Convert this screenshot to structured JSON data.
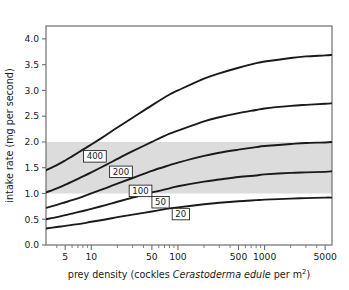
{
  "chart_data": {
    "type": "line",
    "title": "",
    "xlabel": "prey density (cockles Cerastoderma edule per m2)",
    "xlabel_parts": {
      "before": "prey density (cockles ",
      "italic": "Cerastoderma edule",
      "after": " per m",
      "superscript": "2",
      "tail": ")"
    },
    "ylabel": "intake rate (mg per second)",
    "xscale": "log",
    "yscale": "linear",
    "xlim": [
      3,
      6000
    ],
    "ylim": [
      0.0,
      4.25
    ],
    "grid": false,
    "legend": "inline-curve-labels",
    "xticks": [
      5,
      10,
      50,
      100,
      500,
      1000,
      5000
    ],
    "xticklabels": [
      "5",
      "10",
      "50",
      "100",
      "500",
      "1000",
      "5000"
    ],
    "xminorticks": [
      4,
      6,
      7,
      8,
      9,
      20,
      30,
      40,
      60,
      70,
      80,
      90,
      200,
      300,
      400,
      600,
      700,
      800,
      900,
      2000,
      3000,
      4000
    ],
    "yticks": [
      0.0,
      0.5,
      1.0,
      1.5,
      2.0,
      2.5,
      3.0,
      3.5,
      4.0
    ],
    "yticklabels": [
      "0.0",
      "0.5",
      "1.0",
      "1.5",
      "2.0",
      "2.5",
      "3.0",
      "3.5",
      "4.0"
    ],
    "shaded_band": {
      "label": "shaded band",
      "y_from": 1.0,
      "y_to": 2.0,
      "color": "#dcdcdc"
    },
    "series": [
      {
        "name": "400",
        "label": "400",
        "color": "#1a1a1a",
        "label_point": {
          "x": 11,
          "y": 1.72
        },
        "x": [
          3,
          4,
          5,
          6,
          8,
          10,
          15,
          20,
          30,
          50,
          80,
          100,
          200,
          300,
          500,
          800,
          1000,
          2000,
          3000,
          5000,
          6000
        ],
        "y": [
          1.45,
          1.55,
          1.64,
          1.72,
          1.85,
          1.95,
          2.14,
          2.28,
          2.47,
          2.71,
          2.92,
          3.0,
          3.23,
          3.33,
          3.44,
          3.53,
          3.56,
          3.63,
          3.66,
          3.68,
          3.69
        ]
      },
      {
        "name": "200",
        "label": "200",
        "color": "#1a1a1a",
        "label_point": {
          "x": 22,
          "y": 1.42
        },
        "x": [
          3,
          4,
          5,
          6,
          8,
          10,
          15,
          20,
          30,
          50,
          80,
          100,
          200,
          300,
          500,
          800,
          1000,
          2000,
          3000,
          5000,
          6000
        ],
        "y": [
          1.02,
          1.1,
          1.17,
          1.23,
          1.33,
          1.41,
          1.56,
          1.67,
          1.82,
          2.0,
          2.16,
          2.22,
          2.4,
          2.48,
          2.56,
          2.62,
          2.65,
          2.7,
          2.72,
          2.74,
          2.75
        ]
      },
      {
        "name": "100",
        "label": "100",
        "color": "#1a1a1a",
        "label_point": {
          "x": 37,
          "y": 1.05
        },
        "x": [
          3,
          4,
          5,
          6,
          8,
          10,
          15,
          20,
          30,
          50,
          80,
          100,
          200,
          300,
          500,
          800,
          1000,
          2000,
          3000,
          5000,
          6000
        ],
        "y": [
          0.72,
          0.78,
          0.83,
          0.87,
          0.94,
          1.0,
          1.11,
          1.19,
          1.3,
          1.44,
          1.55,
          1.6,
          1.73,
          1.79,
          1.85,
          1.9,
          1.92,
          1.96,
          1.98,
          1.99,
          2.0
        ]
      },
      {
        "name": "50",
        "label": "50",
        "color": "#1a1a1a",
        "label_point": {
          "x": 63,
          "y": 0.83
        },
        "x": [
          3,
          4,
          5,
          6,
          8,
          10,
          15,
          20,
          30,
          50,
          80,
          100,
          200,
          300,
          500,
          800,
          1000,
          2000,
          3000,
          5000,
          6000
        ],
        "y": [
          0.5,
          0.54,
          0.58,
          0.61,
          0.66,
          0.7,
          0.78,
          0.84,
          0.92,
          1.02,
          1.1,
          1.14,
          1.23,
          1.27,
          1.32,
          1.35,
          1.37,
          1.4,
          1.41,
          1.42,
          1.43
        ]
      },
      {
        "name": "20",
        "label": "20",
        "color": "#1a1a1a",
        "label_point": {
          "x": 108,
          "y": 0.6
        },
        "x": [
          3,
          4,
          5,
          6,
          8,
          10,
          15,
          20,
          30,
          50,
          80,
          100,
          200,
          300,
          500,
          800,
          1000,
          2000,
          3000,
          5000,
          6000
        ],
        "y": [
          0.32,
          0.35,
          0.37,
          0.39,
          0.42,
          0.45,
          0.5,
          0.54,
          0.59,
          0.65,
          0.71,
          0.73,
          0.79,
          0.82,
          0.85,
          0.87,
          0.88,
          0.9,
          0.91,
          0.92,
          0.92
        ]
      }
    ]
  }
}
